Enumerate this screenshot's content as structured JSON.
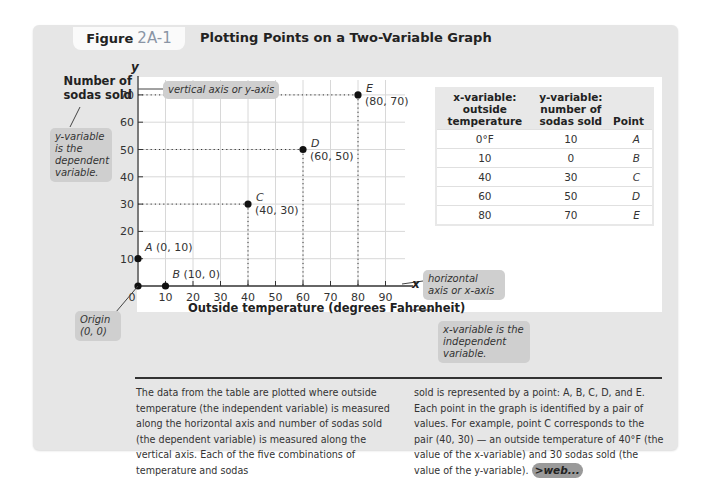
{
  "figure": {
    "label_word": "Figure",
    "label_number": "2A-1",
    "title": "Plotting Points on a Two-Variable Graph"
  },
  "annotations": {
    "y_axis_title": "Number of sodas sold",
    "y_axis_letter": "y",
    "x_axis_letter": "x",
    "x_axis_title": "Outside temperature (degrees Fahrenheit)",
    "vertical_axis_callout": "vertical axis or y-axis",
    "y_variable_callout": "y-variable is the dependent variable.",
    "origin_callout": "Origin (0, 0)",
    "horizontal_axis_callout": "horizontal axis or x-axis",
    "x_variable_callout": "x-variable is the independent variable."
  },
  "table": {
    "headers": [
      "x-variable: outside temperature",
      "y-variable: number of sodas sold",
      "Point"
    ],
    "rows": [
      [
        "0°F",
        "10",
        "A"
      ],
      [
        "10",
        "0",
        "B"
      ],
      [
        "40",
        "30",
        "C"
      ],
      [
        "60",
        "50",
        "D"
      ],
      [
        "80",
        "70",
        "E"
      ]
    ]
  },
  "caption": {
    "col1": "The data from the table are plotted where outside temperature (the independent variable) is measured along the horizontal axis and number of sodas sold (the dependent variable) is measured along the vertical axis. Each of the five combinations of temperature and sodas",
    "col2": "sold is represented by a point: A, B, C, D, and E. Each point in the graph is identified by a pair of values. For example, point C corresponds to the pair (40, 30) — an outside temperature of 40°F (the value of the x-variable) and 30 sodas sold (the value of the y-variable).",
    "web_badge": ">web..."
  },
  "chart_data": {
    "type": "scatter",
    "title": "Plotting Points on a Two-Variable Graph",
    "xlabel": "Outside temperature (degrees Fahrenheit)",
    "ylabel": "Number of sodas sold",
    "xlim": [
      0,
      95
    ],
    "ylim": [
      0,
      78
    ],
    "x_ticks": [
      0,
      10,
      20,
      30,
      40,
      50,
      60,
      70,
      80,
      90
    ],
    "y_ticks": [
      10,
      20,
      30,
      40,
      50,
      60,
      70
    ],
    "grid": true,
    "points": [
      {
        "name": "A",
        "x": 0,
        "y": 10,
        "label": "(0, 10)"
      },
      {
        "name": "B",
        "x": 10,
        "y": 0,
        "label": "(10, 0)"
      },
      {
        "name": "C",
        "x": 40,
        "y": 30,
        "label": "(40, 30)"
      },
      {
        "name": "D",
        "x": 60,
        "y": 50,
        "label": "(60, 50)"
      },
      {
        "name": "E",
        "x": 80,
        "y": 70,
        "label": "(80, 70)"
      }
    ],
    "origin": {
      "x": 0,
      "y": 0
    }
  },
  "colors": {
    "card_bg": "#e6e6e6",
    "callout_bg": "#cfcfcf",
    "figure_number": "#8a95a5",
    "grid": "#d8d8d8",
    "point": "#111111"
  }
}
